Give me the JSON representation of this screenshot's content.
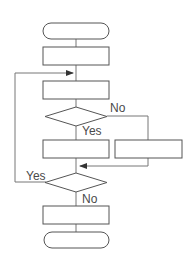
{
  "diagram": {
    "type": "flowchart",
    "nodes": [
      {
        "id": "start",
        "shape": "terminal",
        "label": ""
      },
      {
        "id": "process1",
        "shape": "rectangle",
        "label": ""
      },
      {
        "id": "process2",
        "shape": "rectangle",
        "label": ""
      },
      {
        "id": "decision1",
        "shape": "diamond",
        "label": ""
      },
      {
        "id": "process3",
        "shape": "rectangle",
        "label": ""
      },
      {
        "id": "process_alt",
        "shape": "rectangle",
        "label": ""
      },
      {
        "id": "decision2",
        "shape": "diamond",
        "label": ""
      },
      {
        "id": "process4",
        "shape": "rectangle",
        "label": ""
      },
      {
        "id": "end",
        "shape": "terminal",
        "label": ""
      }
    ],
    "edges": [
      {
        "from": "start",
        "to": "process1",
        "label": ""
      },
      {
        "from": "process1",
        "to": "process2",
        "label": ""
      },
      {
        "from": "process2",
        "to": "decision1",
        "label": ""
      },
      {
        "from": "decision1",
        "to": "process3",
        "label": "Yes"
      },
      {
        "from": "decision1",
        "to": "process_alt",
        "label": "No"
      },
      {
        "from": "process3",
        "to": "decision2",
        "label": ""
      },
      {
        "from": "process_alt",
        "to": "decision2",
        "label": ""
      },
      {
        "from": "decision2",
        "to": "process2",
        "label": "Yes"
      },
      {
        "from": "decision2",
        "to": "process4",
        "label": "No"
      },
      {
        "from": "process4",
        "to": "end",
        "label": ""
      }
    ],
    "labels": {
      "decision1_no": "No",
      "decision1_yes": "Yes",
      "decision2_yes": "Yes",
      "decision2_no": "No"
    }
  }
}
